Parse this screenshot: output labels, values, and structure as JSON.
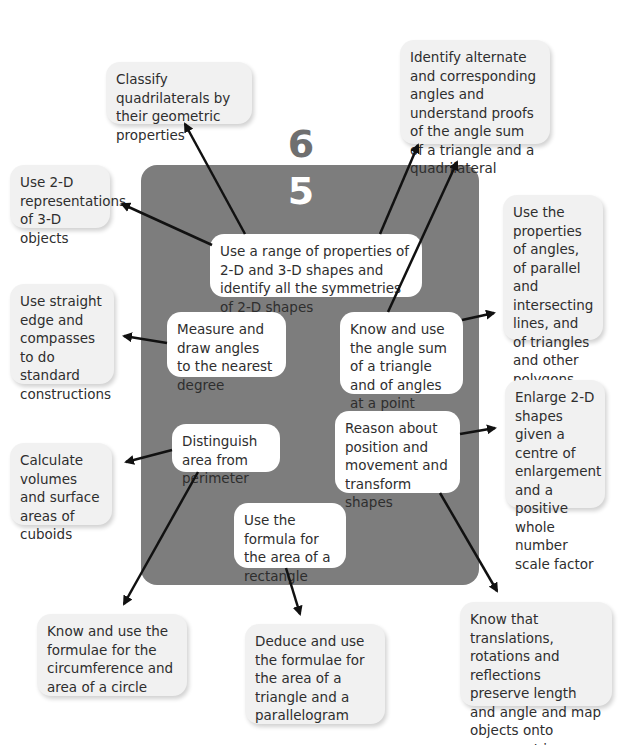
{
  "levels": {
    "upper": "6",
    "lower": "5"
  },
  "colors": {
    "panel": "#7d7d7d",
    "outer_box": "#f1f1f1",
    "inner_box": "#ffffff",
    "arrow": "#111111",
    "level_6": "#6f6f6f",
    "level_5": "#ffffff"
  },
  "inner_nodes": {
    "shapes_2d_3d": "Use a range of properties of 2-D and 3-D shapes and identify all the symmetries of 2-D shapes",
    "measure_angles": "Measure and draw angles to the nearest degree",
    "angle_sum": "Know and use the angle sum of a triangle and of angles at a point",
    "position_movement": "Reason about position and movement and transform shapes",
    "area_perimeter": "Distinguish area from perimeter",
    "rectangle_area": "Use the formula for the area of a rectangle"
  },
  "outer_nodes": {
    "classify_quadrilaterals": "Classify quadrilaterals by their geometric properties",
    "alternate_angles": "Identify alternate and corresponding angles and understand proofs of the angle sum of a triangle and a quadrilateral",
    "representations_3d": "Use 2-D representations of 3-D objects",
    "properties_angles": "Use the properties of angles, of parallel and intersecting lines, and of triangles and other polygons",
    "constructions": "Use straight edge and compasses to do standard constructions",
    "enlarge_shapes": "Enlarge 2-D shapes given a centre of enlargement and a positive whole number scale factor",
    "cuboids": "Calculate volumes and surface areas of cuboids",
    "circle_formulae": "Know and use the formulae for the circumference and area of a circle",
    "triangle_parallelogram": "Deduce and use the formulae for the area of a triangle and a parallelogram",
    "transformations": "Know that translations, rotations and reflections preserve length and angle and map objects onto congruent images"
  }
}
